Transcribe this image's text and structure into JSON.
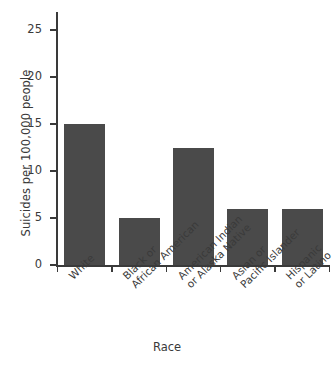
{
  "chart_data": {
    "type": "bar",
    "title": "",
    "subtitle": "",
    "xlabel": "Race",
    "ylabel": "Suicides per 100,000 people",
    "categories": [
      "White",
      "Black or\nAfrican American",
      "American Indian\nor Alaska Native",
      "Asian or\nPacific Islander",
      "Hispanic\nor Latino"
    ],
    "values": [
      15,
      5,
      12.5,
      6,
      6
    ],
    "ylim": [
      0,
      25
    ],
    "yticks": [
      0,
      5,
      10,
      15,
      20,
      25
    ],
    "ytick_labels": [
      "0",
      "5",
      "10",
      "15",
      "20",
      "25"
    ],
    "grid": false,
    "legend": null,
    "bar_color": "#4a4a4a",
    "axis_color": "#3a3a3a",
    "background": "#ffffff"
  },
  "axes": {
    "y_title": "Suicides per 100,000 people",
    "x_title": "Race"
  },
  "ticks": {
    "y": [
      {
        "label": "25",
        "value": 25
      },
      {
        "label": "20",
        "value": 20
      },
      {
        "label": "15",
        "value": 15
      },
      {
        "label": "10",
        "value": 10
      },
      {
        "label": "5",
        "value": 5
      },
      {
        "label": "0",
        "value": 0
      }
    ]
  },
  "categories": [
    {
      "line1": "White",
      "line2": ""
    },
    {
      "line1": "Black or",
      "line2": "African American"
    },
    {
      "line1": "American Indian",
      "line2": "or Alaska Native"
    },
    {
      "line1": "Asian or",
      "line2": "Pacific Islander"
    },
    {
      "line1": "Hispanic",
      "line2": "or Latino"
    }
  ]
}
